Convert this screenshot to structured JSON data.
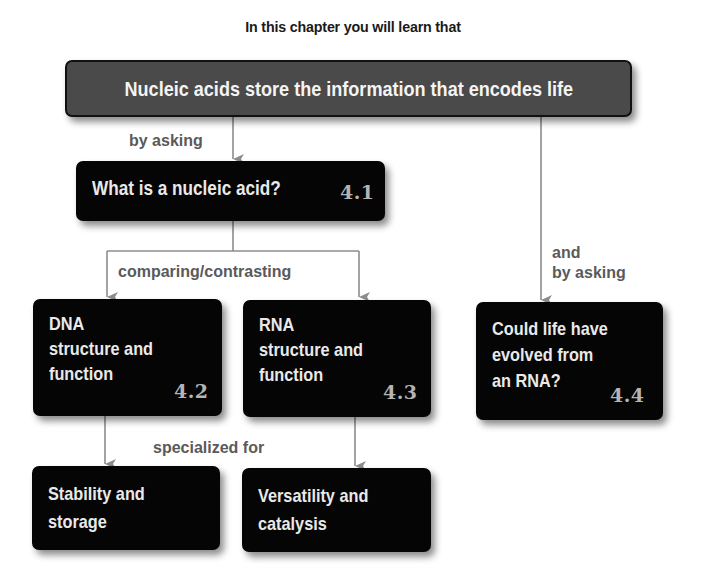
{
  "heading": "In this chapter you will learn that",
  "main_concept": {
    "label": "Nucleic acids store the information that encodes life"
  },
  "edges": {
    "by_asking": "by asking",
    "comparing_contrasting": "comparing/contrasting",
    "specialized_for": "specialized for",
    "and_by_asking": "and\nby asking"
  },
  "nodes": {
    "q41": {
      "label": "What is a nucleic acid?",
      "section": "4.1"
    },
    "q42": {
      "label": "DNA\nstructure and\nfunction",
      "section": "4.2"
    },
    "q43": {
      "label": "RNA\nstructure and\nfunction",
      "section": "4.3"
    },
    "q44": {
      "label": "Could life have\nevolved from\nan RNA?",
      "section": "4.4"
    },
    "dna_role": {
      "label": "Stability and\nstorage"
    },
    "rna_role": {
      "label": "Versatility and\ncatalysis"
    }
  },
  "colors": {
    "main_box": "#4a4a4a",
    "node_box": "#050505",
    "node_text": "#e9e9e9",
    "section_number": "#b4b4b4",
    "connector": "#8c8c8c",
    "edge_label": "#5a5a5a"
  }
}
